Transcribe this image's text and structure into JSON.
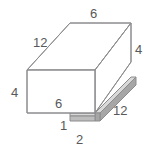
{
  "figure": {
    "shape_type": "rectangular-prism",
    "projection": "oblique",
    "colors": {
      "outline": "#8c8c8e",
      "face_fill": "#ffffff",
      "slab_top_gray": "#d9d9d9",
      "slab_side_gray": "#a6a6a6",
      "label_text": "#58585a",
      "background": "#ffffff"
    },
    "labels": [
      {
        "id": "top-edge",
        "text": "6",
        "edge": "top-back-horizontal"
      },
      {
        "id": "left-depth",
        "text": "12",
        "edge": "top-left-depth"
      },
      {
        "id": "right-height",
        "text": "4",
        "edge": "back-right-vertical"
      },
      {
        "id": "left-height",
        "text": "4",
        "edge": "front-left-vertical"
      },
      {
        "id": "front-width",
        "text": "6",
        "edge": "front-face-width"
      },
      {
        "id": "slab-thickness",
        "text": "1",
        "edge": "slab-height"
      },
      {
        "id": "slab-width",
        "text": "2",
        "edge": "slab-front-depth"
      },
      {
        "id": "slab-length",
        "text": "12",
        "edge": "slab-right-length"
      }
    ],
    "dimensions": {
      "prism_length": "6",
      "prism_depth": "12",
      "prism_height": "4",
      "slab_thickness": "1",
      "slab_width": "2",
      "slab_length": "12"
    }
  }
}
